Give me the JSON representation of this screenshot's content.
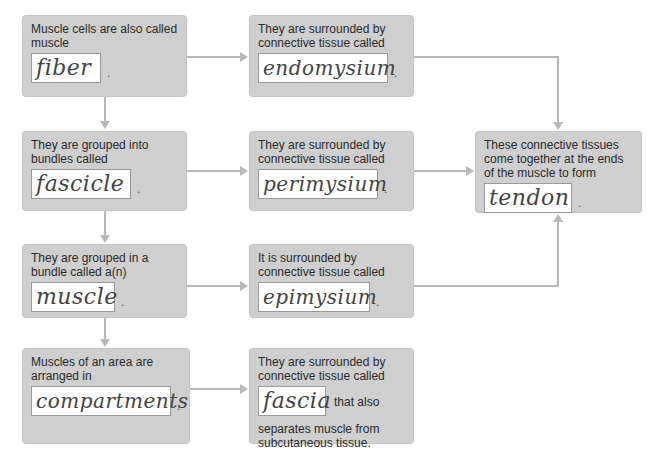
{
  "diagram": {
    "left_column": [
      {
        "prompt": "Muscle cells are also called muscle",
        "answer": "fiber"
      },
      {
        "prompt": "They are grouped into bundles called",
        "answer": "fascicle"
      },
      {
        "prompt": "They are grouped in a bundle called a(n)",
        "answer": "muscle"
      },
      {
        "prompt": "Muscles of an area are arranged in",
        "answer": "compartments"
      }
    ],
    "middle_column": [
      {
        "prompt": "They are surrounded by connective tissue called",
        "answer": "endomysium"
      },
      {
        "prompt": "They are surrounded by connective tissue called",
        "answer": "perimysium"
      },
      {
        "prompt": "It is surrounded by connective tissue called",
        "answer": "epimysium"
      },
      {
        "prompt": "They are surrounded by connective tissue called",
        "answer": "fascia",
        "suffix": "that also",
        "after": "separates muscle from subcutaneous tissue."
      }
    ],
    "right_box": {
      "prompt": "These connective tissues come together at the ends of the muscle to form",
      "answer": "tendon"
    },
    "colors": {
      "box_fill": "#cfcfcf",
      "connector": "#b8b8b8",
      "answer_fill": "#ffffff"
    }
  }
}
